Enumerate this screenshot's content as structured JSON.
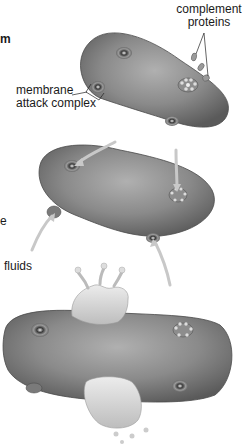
{
  "diagram": {
    "labels": {
      "complement_proteins_line1": "complement",
      "complement_proteins_line2": "proteins",
      "mac_line1": "membrane",
      "mac_line2": "attack complex",
      "fluids": "fluids",
      "cut_left_top": "m",
      "cut_left_mid": "e"
    },
    "stages": [
      {
        "name": "complement proteins bind to bacterial membrane",
        "pores": 4
      },
      {
        "name": "fluids enter through membrane attack complexes",
        "pores": 4
      },
      {
        "name": "cell bursts / lysis",
        "pores": 4
      }
    ],
    "colors": {
      "cell_dark": "#5e5e5e",
      "cell_mid": "#8a8a8a",
      "cell_light": "#b5b5b5",
      "arrow": "#c8c8c8",
      "fluid": "#d9d9d9",
      "text": "#1a1a1a"
    }
  }
}
